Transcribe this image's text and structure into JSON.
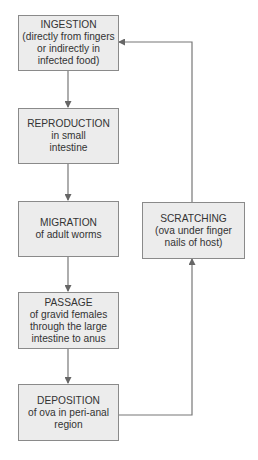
{
  "diagram": {
    "type": "flowchart",
    "colors": {
      "box_fill": "#ececec",
      "box_border": "#8a8a8a",
      "connector": "#777777",
      "text": "#333333"
    },
    "nodes": [
      {
        "id": "ingestion",
        "title": "INGESTION",
        "desc_lines": [
          "(directly from fingers",
          "or indirectly in",
          "infected food)"
        ]
      },
      {
        "id": "reproduction",
        "title": "REPRODUCTION",
        "desc_lines": [
          "in small",
          "intestine"
        ]
      },
      {
        "id": "migration",
        "title": "MIGRATION",
        "desc_lines": [
          "of adult worms"
        ]
      },
      {
        "id": "passage",
        "title": "PASSAGE",
        "desc_lines": [
          "of gravid females",
          "through the large",
          "intestine to anus"
        ]
      },
      {
        "id": "deposition",
        "title": "DEPOSITION",
        "desc_lines": [
          "of ova in peri-anal",
          "region"
        ]
      },
      {
        "id": "scratching",
        "title": "SCRATCHING",
        "desc_lines": [
          "(ova under finger",
          "nails of host)"
        ]
      }
    ],
    "edges": [
      {
        "from": "ingestion",
        "to": "reproduction"
      },
      {
        "from": "reproduction",
        "to": "migration"
      },
      {
        "from": "migration",
        "to": "passage"
      },
      {
        "from": "passage",
        "to": "deposition"
      },
      {
        "from": "deposition",
        "to": "scratching"
      },
      {
        "from": "scratching",
        "to": "ingestion"
      }
    ]
  }
}
